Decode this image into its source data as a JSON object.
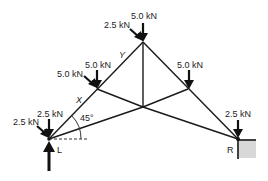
{
  "figure": {
    "type": "roof-truss-free-body-diagram",
    "loads": {
      "apex_vertical": "5.0 kN",
      "apex_inclined": "2.5 kN",
      "left_upper_vertical": "5.0 kN",
      "left_upper_inclined": "5.0 kN",
      "right_upper_vertical": "5.0 kN",
      "left_support_vertical": "2.5 kN",
      "left_support_inclined": "2.5 kN",
      "right_support_vertical": "2.5 kN"
    },
    "member_labels": {
      "lower_left_rafter": "X",
      "upper_left_rafter": "Y"
    },
    "angle_label": "45°",
    "support_labels": {
      "left": "L",
      "right": "R"
    }
  }
}
